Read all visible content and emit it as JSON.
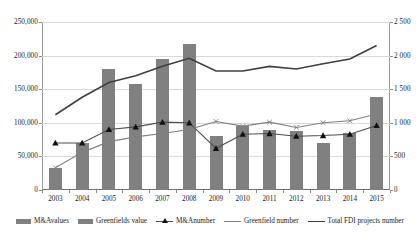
{
  "chart_data": {
    "type": "bar",
    "title": "",
    "subtitle": "",
    "xlabel": "",
    "ylabel": "",
    "categories": [
      "2003",
      "2004",
      "2005",
      "2006",
      "2007",
      "2008",
      "2009",
      "2010",
      "2011",
      "2012",
      "2013",
      "2014",
      "2015"
    ],
    "y_left": {
      "label": "",
      "ticks": [
        "0",
        "50,000",
        "100,000",
        "150,000",
        "200,000",
        "250,000"
      ],
      "tick_values": [
        0,
        50000,
        100000,
        150000,
        200000,
        250000
      ],
      "ylim": [
        0,
        250000
      ]
    },
    "y_right": {
      "label": "",
      "ticks": [
        "0",
        "500",
        "1 000",
        "1 500",
        "2 000",
        "2 500"
      ],
      "tick_values": [
        0,
        500,
        1000,
        1500,
        2000,
        2500
      ],
      "ylim": [
        0,
        2500
      ]
    },
    "grid": true,
    "legend_position": "bottom",
    "series": [
      {
        "name": "M&Avalues",
        "type": "bar",
        "axis": "left",
        "color": "#808080",
        "values": [
          33000,
          70000,
          180000,
          158000,
          195000,
          217000,
          80000,
          95000,
          90000,
          88000,
          70000,
          85000,
          138000
        ]
      },
      {
        "name": "Greenfields value",
        "type": "bar",
        "axis": "left",
        "color": "#808080",
        "values": [
          33000,
          70000,
          180000,
          158000,
          195000,
          217000,
          80000,
          95000,
          90000,
          88000,
          70000,
          85000,
          138000
        ]
      },
      {
        "name": "M&Anumber",
        "type": "line-marker",
        "axis": "right",
        "color": "#4d4d4d",
        "marker": "triangle",
        "values": [
          700,
          700,
          900,
          940,
          1010,
          1000,
          620,
          830,
          840,
          800,
          810,
          830,
          960
        ]
      },
      {
        "name": "Greenfield number",
        "type": "line",
        "axis": "right",
        "color": "#808080",
        "values": [
          330,
          560,
          720,
          790,
          840,
          900,
          1020,
          950,
          1010,
          930,
          1000,
          1030,
          1130
        ]
      },
      {
        "name": "Total FDI projects number",
        "type": "line",
        "axis": "right",
        "color": "#3f3f3f",
        "values": [
          1120,
          1380,
          1600,
          1700,
          1840,
          1960,
          1770,
          1770,
          1840,
          1800,
          1880,
          1950,
          2150
        ]
      }
    ]
  },
  "legend": {
    "items": [
      {
        "label": "M&Avalues",
        "marker": "bar",
        "color": "#808080"
      },
      {
        "label": "Greenfields value",
        "marker": "bar",
        "color": "#808080"
      },
      {
        "label": "M&Anumber",
        "marker": "line-triangle",
        "color": "#4d4d4d"
      },
      {
        "label": "Greenfield number",
        "marker": "line",
        "color": "#808080"
      },
      {
        "label": "Total FDI projects number",
        "marker": "line",
        "color": "#3f3f3f"
      }
    ]
  }
}
